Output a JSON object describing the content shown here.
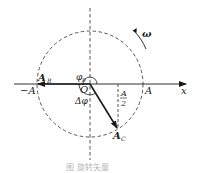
{
  "diagram": {
    "type": "rotating-vector",
    "colors": {
      "ink": "#1a1a1a",
      "dashed": "#444444",
      "caption": "#b8b8b8",
      "background": "#ffffff"
    },
    "axis": {
      "x_label": "x"
    },
    "labels": {
      "neg_amplitude": "−A",
      "pos_amplitude": "A",
      "origin": "O",
      "vector_b": "A",
      "vector_b_sub": "B",
      "vector_c": "A",
      "vector_c_sub": "C",
      "phase_b": "φ",
      "phase_b_sub": "B",
      "delta_phi": "Δφ",
      "half_amp_num": "A",
      "half_amp_den": "2",
      "omega": "ω"
    },
    "caption": "图    旋转矢量"
  }
}
